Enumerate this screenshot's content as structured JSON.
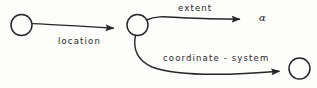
{
  "diagram": {
    "background_color": "#fdfdfc",
    "stroke_color": "#262626",
    "nodes": [
      {
        "id": "node-source",
        "name": "node-circle-source",
        "label": "",
        "cx": 21.5,
        "cy": 25,
        "r": 10.5
      },
      {
        "id": "node-hub",
        "name": "node-circle-hub",
        "label": "",
        "cx": 137.5,
        "cy": 25,
        "r": 10.5
      },
      {
        "id": "node-destination",
        "name": "node-circle-destination",
        "label": "",
        "cx": 299.5,
        "cy": 68.5,
        "r": 10.5
      }
    ],
    "edges": [
      {
        "id": "edge-location",
        "label": "location",
        "from": "node-source",
        "to": "node-hub",
        "arrow": true
      },
      {
        "id": "edge-extent",
        "label": "extent",
        "from": "node-hub",
        "to": "term-alpha",
        "arrow": true
      },
      {
        "id": "edge-coordsys",
        "label": "coordinate - system",
        "from": "node-hub",
        "to": "node-destination",
        "arrow": true
      }
    ],
    "terminals": [
      {
        "id": "term-alpha",
        "label": "α",
        "name": "terminal-label-alpha"
      }
    ]
  }
}
